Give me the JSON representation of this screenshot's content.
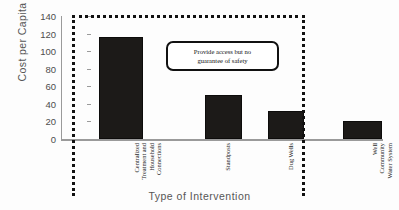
{
  "chart_data": {
    "type": "bar",
    "title": "",
    "xlabel": "Type of Intervention",
    "ylabel": "Cost per Capita",
    "ylim": [
      0,
      140
    ],
    "ytick_step": 20,
    "yticks": [
      0,
      20,
      40,
      60,
      80,
      100,
      120,
      140
    ],
    "grid": false,
    "legend": "none",
    "categories": [
      "Centralized Treatment and Household Connections",
      "Standposts",
      "Dug Wells",
      "Well Community Water System"
    ],
    "category_lines": [
      [
        "Centralized",
        "Treatment and",
        "Household",
        "Connections"
      ],
      [
        "Standposts"
      ],
      [
        "Dug Wells"
      ],
      [
        "Well",
        "Community",
        "Water System"
      ]
    ],
    "values": [
      116,
      50,
      32,
      20
    ],
    "bar_color": "#1c1a18",
    "annotations": [
      {
        "name": "callout",
        "text": "Provide access but no guarantee of safety",
        "lines": [
          "Provide access but no",
          "guarantee of safety"
        ]
      },
      {
        "name": "dotted-grouping-box",
        "covers": [
          "Centralized Treatment and Household Connections",
          "Standposts",
          "Dug Wells"
        ],
        "style": "dotted",
        "color": "#111111"
      }
    ]
  },
  "axes": {
    "y_title": "Cost per Capita",
    "x_title": "Type of Intervention",
    "y_tick_labels": [
      "140",
      "120",
      "100",
      "80",
      "60",
      "40",
      "20",
      "0"
    ]
  }
}
